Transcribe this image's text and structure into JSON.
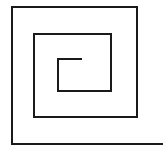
{
  "diagram": {
    "type": "square-spiral",
    "stroke_color": "#1a1a1a",
    "background": "#ffffff",
    "stroke_width": 2,
    "points": [
      [
        82,
        59
      ],
      [
        58,
        59
      ],
      [
        58,
        91
      ],
      [
        111,
        91
      ],
      [
        111,
        34
      ],
      [
        34,
        34
      ],
      [
        34,
        117
      ],
      [
        137,
        117
      ],
      [
        137,
        7
      ],
      [
        12,
        7
      ],
      [
        12,
        144
      ],
      [
        163,
        144
      ]
    ]
  }
}
